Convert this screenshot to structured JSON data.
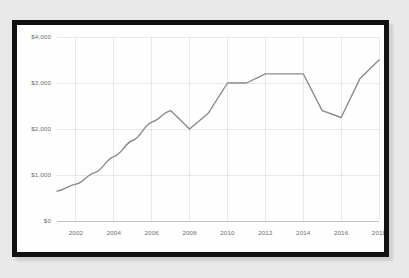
{
  "chart_data": {
    "type": "line",
    "title": "",
    "subtitle": "",
    "xlabel": "",
    "ylabel": "",
    "x": [
      2001,
      2002,
      2003,
      2004,
      2005,
      2006,
      2007,
      2008,
      2009,
      2010,
      2011,
      2012,
      2013,
      2014,
      2015,
      2016,
      2017,
      2018
    ],
    "values": [
      650,
      800,
      1050,
      1400,
      1750,
      2150,
      2400,
      2000,
      2350,
      3000,
      3000,
      3200,
      3200,
      3200,
      2400,
      2250,
      3100,
      3500
    ],
    "series": [
      {
        "name": "",
        "color": "#8a8a8a",
        "values": [
          650,
          800,
          1050,
          1400,
          1750,
          2150,
          2400,
          2000,
          2350,
          3000,
          3000,
          3200,
          3200,
          3200,
          2400,
          2250,
          3100,
          3500
        ]
      }
    ],
    "xlim": [
      2001,
      2018
    ],
    "ylim": [
      0,
      4000
    ],
    "x_ticks": [
      2002,
      2004,
      2006,
      2008,
      2010,
      2012,
      2014,
      2016,
      2018
    ],
    "x_tick_labels": [
      "2002",
      "2004",
      "2006",
      "2008",
      "2010",
      "2012",
      "2014",
      "2016",
      "2018"
    ],
    "y_ticks": [
      0,
      1000,
      2000,
      3000,
      4000
    ],
    "y_tick_labels": [
      "$0",
      "$1,000",
      "$2,000",
      "$3,000",
      "$4,000"
    ],
    "grid": true,
    "grid_color": "#d9d9d9",
    "legend": false,
    "legend_position": "none",
    "background_color": "#fefefe",
    "frame_color": "#111111",
    "page_background_color": "#e9e9e9"
  }
}
